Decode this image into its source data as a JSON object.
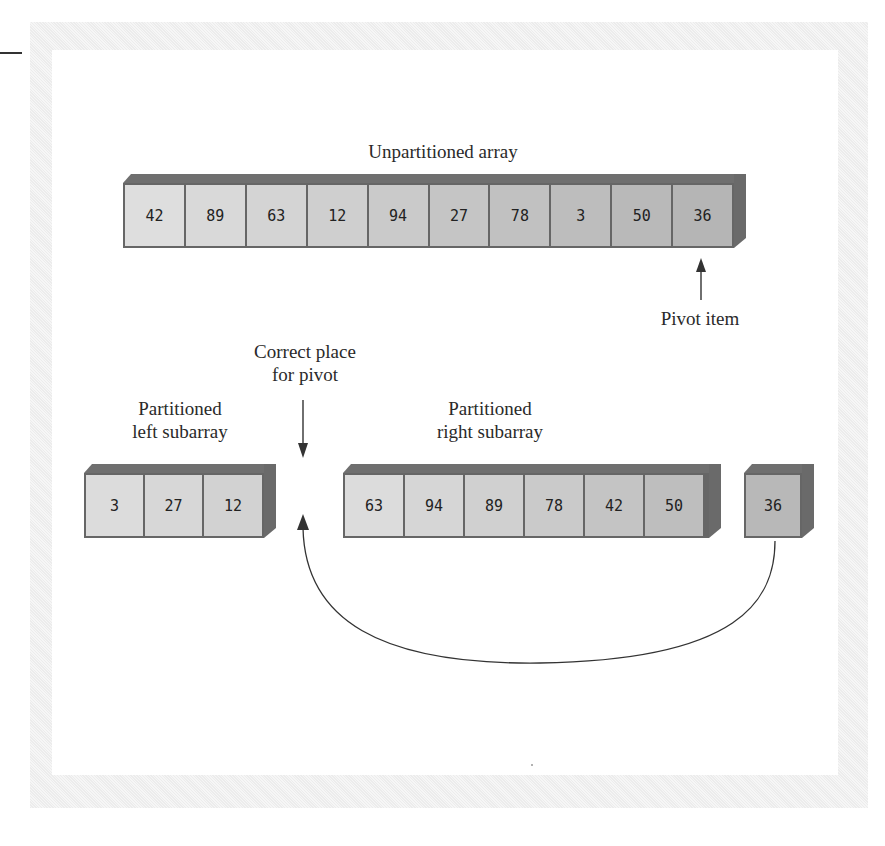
{
  "labels": {
    "unpartitioned": "Unpartitioned array",
    "pivot_item": "Pivot item",
    "correct_place_line1": "Correct place",
    "correct_place_line2": "for pivot",
    "left_line1": "Partitioned",
    "left_line2": "left subarray",
    "right_line1": "Partitioned",
    "right_line2": "right subarray"
  },
  "unpartitioned_array": [
    "42",
    "89",
    "63",
    "12",
    "94",
    "27",
    "78",
    "3",
    "50",
    "36"
  ],
  "left_subarray": [
    "3",
    "27",
    "12"
  ],
  "right_subarray": [
    "63",
    "94",
    "89",
    "78",
    "42",
    "50"
  ],
  "pivot": [
    "36"
  ],
  "colors": {
    "cell_light": "#dcdcdc",
    "cell_dark": "#b4b4b4",
    "box_edge": "#6a6a6a",
    "arrow": "#333333"
  }
}
